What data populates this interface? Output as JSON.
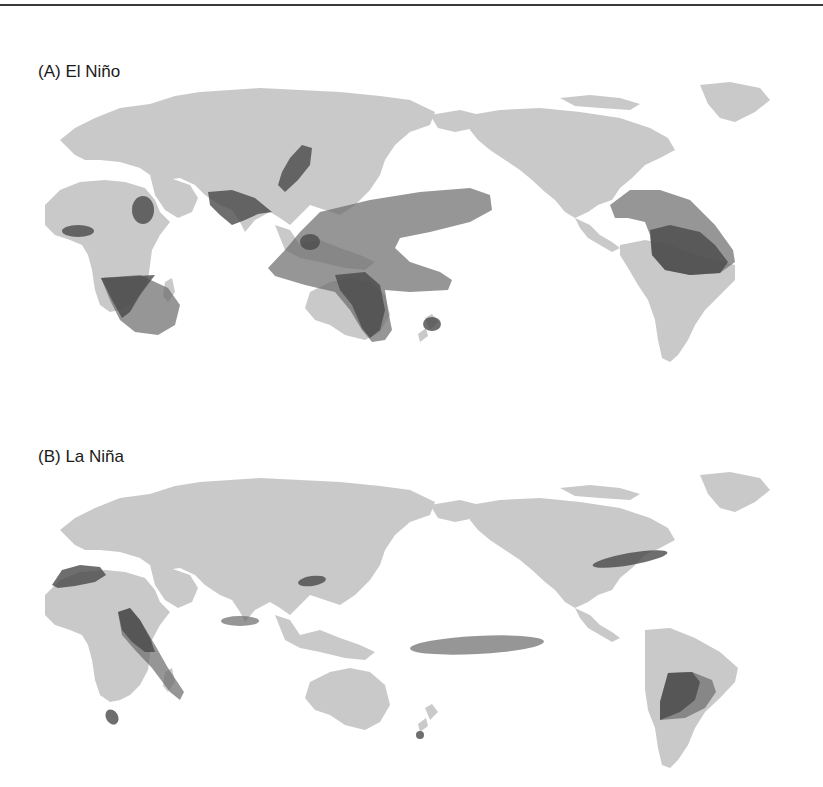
{
  "figure": {
    "panels": [
      {
        "id": "A",
        "title": "(A) El Niño",
        "anomaly_regions": [
          "West Africa (Gulf of Guinea)",
          "Ethiopia / Horn of Africa",
          "Southern Africa",
          "India",
          "Northern China",
          "Indonesia / Maritime Continent / central-western Pacific",
          "Eastern Australia",
          "South-west Pacific band",
          "New Zealand (North Island)",
          "Central America / Caribbean",
          "Northern South America (Amazon)"
        ]
      },
      {
        "id": "B",
        "title": "(B) La Niña",
        "anomaly_regions": [
          "North-west Africa / Iberia",
          "East Africa (Congo to Tanzania)",
          "South Africa (Western Cape)",
          "Sri Lanka / southern India",
          "Eastern China",
          "Central equatorial Pacific",
          "Southern United States",
          "South-eastern South America (Argentina/Uruguay)",
          "New Zealand (South Island)"
        ]
      }
    ],
    "colors": {
      "land": "#c9c9c9",
      "zone": "#6e6e6e",
      "zone_overlap": "#4a4a4a",
      "background": "#ffffff",
      "rule": "#3a3a3a"
    }
  }
}
